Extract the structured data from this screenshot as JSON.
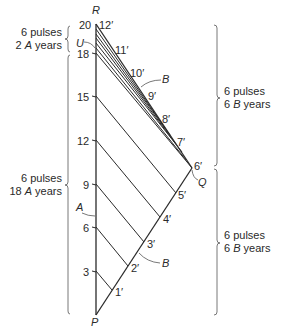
{
  "vertices": {
    "R": "R",
    "P": "P",
    "Q": "Q",
    "U": "U"
  },
  "worldlines": {
    "A_label": "A",
    "B_upper_label": "B",
    "B_lower_label": "B"
  },
  "a_ticks": [
    "3",
    "6",
    "9",
    "12",
    "15",
    "18",
    "20"
  ],
  "b_ticks": [
    "1′",
    "2′",
    "3′",
    "4′",
    "5′",
    "6′",
    "7′",
    "8′",
    "9′",
    "10′",
    "11′",
    "12′"
  ],
  "braces": {
    "left_top": {
      "line1": "6 pulses",
      "line2_num": "2",
      "line2_unit": "A",
      "line2_word": "years"
    },
    "left_bottom": {
      "line1": "6 pulses",
      "line2_num": "18",
      "line2_unit": "A",
      "line2_word": "years"
    },
    "right_top": {
      "line1": "6 pulses",
      "line2_num": "6",
      "line2_unit": "B",
      "line2_word": "years"
    },
    "right_bottom": {
      "line1": "6 pulses",
      "line2_num": "6",
      "line2_unit": "B",
      "line2_word": "years"
    }
  }
}
